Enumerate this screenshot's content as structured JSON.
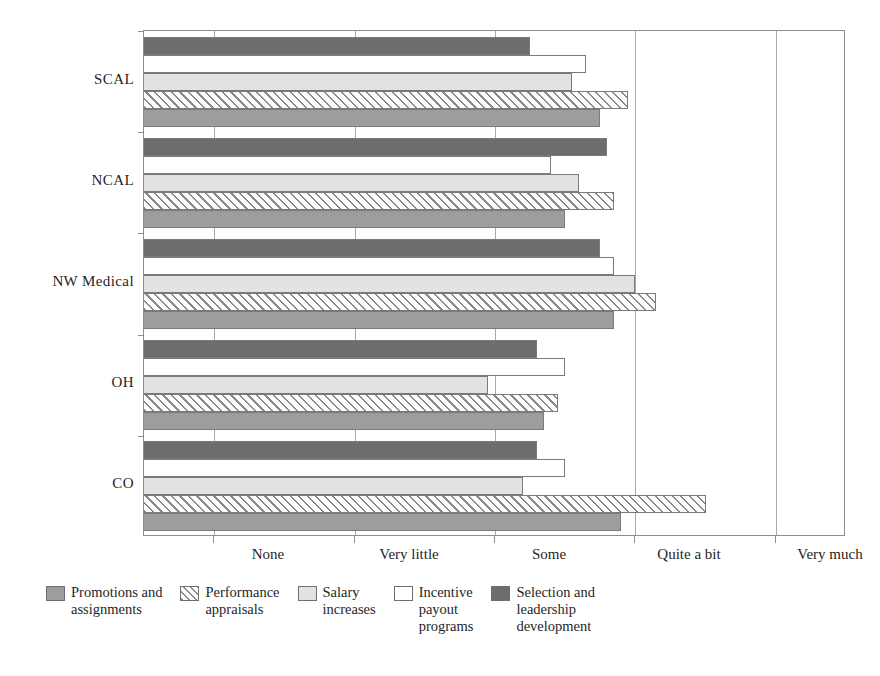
{
  "chart_data": {
    "type": "bar",
    "orientation": "horizontal",
    "title": "",
    "subtitle": "",
    "xlabel": "",
    "ylabel": "",
    "grid": true,
    "grid_axis": "x",
    "legend_position": "bottom",
    "categories": [
      "SCAL",
      "NCAL",
      "NW Medical",
      "OH",
      "CO"
    ],
    "x_tick_labels": [
      "None",
      "Very little",
      "Some",
      "Quite a bit",
      "Very much"
    ],
    "x_tick_values": [
      1,
      2,
      3,
      4,
      5
    ],
    "xlim": [
      0.5,
      5.5
    ],
    "series": [
      {
        "name": "Promotions and assignments",
        "swatch": "s-promotions",
        "color": "#9d9d9d",
        "values": [
          3.75,
          3.5,
          3.85,
          3.35,
          3.9
        ]
      },
      {
        "name": "Performance appraisals",
        "swatch": "s-appraisals",
        "color": "#fdfdfd",
        "values": [
          3.95,
          3.85,
          4.15,
          3.45,
          4.5
        ]
      },
      {
        "name": "Salary increases",
        "swatch": "s-salary",
        "color": "#e2e2e2",
        "values": [
          3.55,
          3.6,
          4.0,
          2.95,
          3.2
        ]
      },
      {
        "name": "Incentive payout programs",
        "swatch": "s-incentive",
        "color": "#ffffff",
        "values": [
          3.65,
          3.4,
          3.85,
          3.5,
          3.5
        ]
      },
      {
        "name": "Selection and leadership development",
        "swatch": "s-selection",
        "color": "#6d6d6d",
        "values": [
          3.25,
          3.8,
          3.75,
          3.3,
          3.3
        ]
      }
    ]
  },
  "legend": {
    "items": [
      {
        "key": "s-promotions",
        "lines": [
          "Promotions and",
          "assignments"
        ]
      },
      {
        "key": "s-appraisals",
        "lines": [
          "Performance",
          "appraisals"
        ]
      },
      {
        "key": "s-salary",
        "lines": [
          "Salary",
          "increases"
        ]
      },
      {
        "key": "s-incentive",
        "lines": [
          "Incentive",
          "payout",
          "programs"
        ]
      },
      {
        "key": "s-selection",
        "lines": [
          "Selection and",
          "leadership",
          "development"
        ]
      }
    ]
  }
}
